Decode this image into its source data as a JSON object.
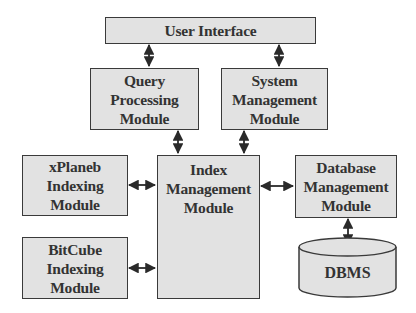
{
  "diagram": {
    "type": "architecture-block-diagram",
    "nodes": {
      "user_interface": {
        "lines": [
          "User Interface"
        ]
      },
      "query_processing": {
        "lines": [
          "Query",
          "Processing",
          "Module"
        ]
      },
      "system_management": {
        "lines": [
          "System",
          "Management",
          "Module"
        ]
      },
      "xplaneb_indexing": {
        "lines": [
          "xPlaneb",
          "Indexing",
          "Module"
        ]
      },
      "index_management": {
        "lines": [
          "Index",
          "Management",
          "Module"
        ]
      },
      "database_management": {
        "lines": [
          "Database",
          "Management",
          "Module"
        ]
      },
      "bitcube_indexing": {
        "lines": [
          "BitCube",
          "Indexing",
          "Module"
        ]
      },
      "dbms": {
        "lines": [
          "DBMS"
        ]
      }
    },
    "edges": [
      {
        "from": "User Interface",
        "to": "Query Processing Module",
        "direction": "bidirectional"
      },
      {
        "from": "User Interface",
        "to": "System Management Module",
        "direction": "bidirectional"
      },
      {
        "from": "Query Processing Module",
        "to": "Index Management Module",
        "direction": "bidirectional"
      },
      {
        "from": "System Management Module",
        "to": "Index Management Module",
        "direction": "bidirectional"
      },
      {
        "from": "xPlaneb Indexing Module",
        "to": "Index Management Module",
        "direction": "bidirectional"
      },
      {
        "from": "BitCube Indexing Module",
        "to": "Index Management Module",
        "direction": "bidirectional"
      },
      {
        "from": "Index Management Module",
        "to": "Database Management Module",
        "direction": "bidirectional"
      },
      {
        "from": "Database Management Module",
        "to": "DBMS",
        "direction": "bidirectional"
      }
    ],
    "colors": {
      "box_fill": "#e2e2e2",
      "border": "#3a3a3a",
      "text": "#333333",
      "background": "#ffffff"
    }
  }
}
